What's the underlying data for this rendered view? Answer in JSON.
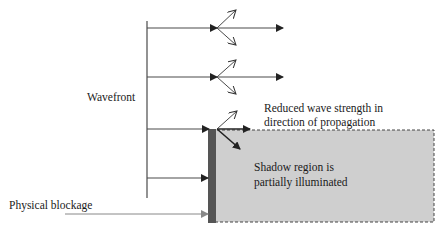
{
  "diagram": {
    "labels": {
      "wavefront": "Wavefront",
      "reduced_line1": "Reduced wave strength in",
      "reduced_line2": "direction of propagation",
      "shadow_line1": "Shadow region is",
      "shadow_line2": "partially illuminated",
      "blockage": "Physical blockage"
    },
    "colors": {
      "line": "#4a4a4a",
      "shadow_fill": "#cfcfcf",
      "blockage_fill": "#555555",
      "dash": "#444444"
    }
  }
}
